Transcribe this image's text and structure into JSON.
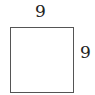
{
  "diagram": {
    "shape": "square",
    "stroke_color": "#555555",
    "labels": {
      "top": "9",
      "right": "9"
    }
  }
}
